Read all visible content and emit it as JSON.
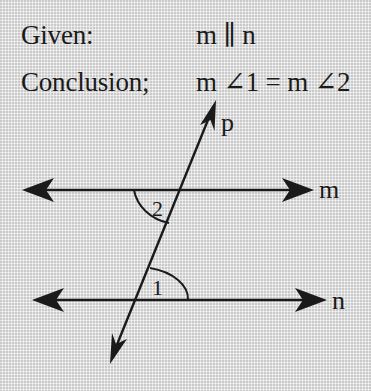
{
  "statements": {
    "given": {
      "label": "Given:",
      "value": "m ∥ n"
    },
    "conclusion": {
      "label": "Conclusion;",
      "value": "m ∠1 = m ∠2"
    }
  },
  "figure": {
    "lines": {
      "m": {
        "label": "m"
      },
      "n": {
        "label": "n"
      },
      "p": {
        "label": "p"
      }
    },
    "angles": {
      "angle_1": {
        "label": "1"
      },
      "angle_2": {
        "label": "2"
      }
    },
    "stroke_color": "#1a1a1a"
  }
}
